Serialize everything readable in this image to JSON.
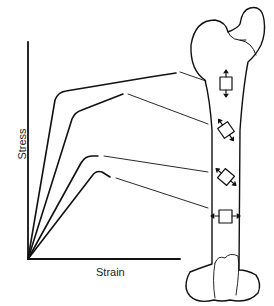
{
  "diagram": {
    "type": "stress-strain curves mapped to femur regions",
    "axes": {
      "x_label": "Strain",
      "y_label": "Stress"
    },
    "curves": [
      {
        "id": "curve-1",
        "region": "proximal femur, axial compression/tension",
        "element_orientation": "square, vertical arrows"
      },
      {
        "id": "curve-2",
        "region": "upper shaft, oblique",
        "element_orientation": "rotated square, diagonal arrows"
      },
      {
        "id": "curve-3",
        "region": "lower shaft, oblique",
        "element_orientation": "rotated square, diagonal arrows"
      },
      {
        "id": "curve-4",
        "region": "distal shaft, transverse",
        "element_orientation": "square, horizontal arrows"
      }
    ],
    "figure": "femur bone outline with four stress elements"
  }
}
